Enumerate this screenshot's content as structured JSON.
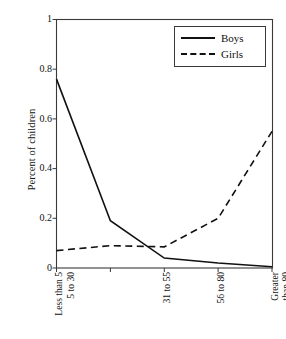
{
  "chart_data": {
    "type": "line",
    "title": "",
    "xlabel": "",
    "ylabel": "Percent of children",
    "ylim": [
      0,
      1
    ],
    "yticks": [
      "0",
      "0.2",
      "0.4",
      "0.6",
      "0.8",
      "1"
    ],
    "ytick_values": [
      0,
      0.2,
      0.4,
      0.6,
      0.8,
      1
    ],
    "grid": false,
    "legend_position": "top-right",
    "categories": [
      "Less than 5",
      "5 to 30",
      "31 to 55",
      "56 to 80",
      "Greater\nthan 80"
    ],
    "series": [
      {
        "name": "Boys",
        "style": "solid",
        "color": "#111111",
        "values": [
          0.76,
          0.19,
          0.04,
          0.02,
          0.005
        ]
      },
      {
        "name": "Girls",
        "style": "dashed",
        "color": "#111111",
        "values": [
          0.07,
          0.09,
          0.085,
          0.2,
          0.55
        ]
      }
    ]
  },
  "axis": {
    "y_title": "Percent of children",
    "y_tick_labels": [
      "1",
      "0.8",
      "0.6",
      "0.4",
      "0.2",
      "0"
    ],
    "x_tick_labels": [
      "Less than 5",
      "5 to 30",
      "31 to 55",
      "56 to 80",
      "Greater\nthan 80"
    ]
  },
  "legend": {
    "entries": [
      {
        "label": "Boys",
        "style": "solid"
      },
      {
        "label": "Girls",
        "style": "dashed"
      }
    ]
  }
}
